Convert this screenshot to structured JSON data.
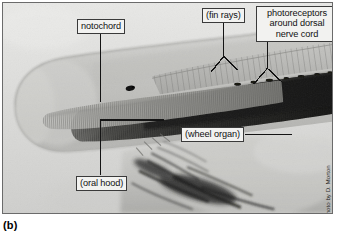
{
  "figure": {
    "panel_letter": "(b)",
    "photo_credit": "Photo by D. Morton"
  },
  "callouts": {
    "notochord": {
      "label": "notochord"
    },
    "fin_rays": {
      "label": "(fin rays)"
    },
    "photoreceptors": {
      "line1": "photoreceptors",
      "line2": "around dorsal",
      "line3": "nerve cord"
    },
    "wheel_organ": {
      "label": "(wheel organ)"
    },
    "oral_hood": {
      "label": "(oral hood)"
    }
  },
  "colors": {
    "frame_border": "#6b6b6b",
    "callout_fill": "#f2f2f0",
    "callout_border": "#3a3a3a",
    "leader_line": "#1a1a1a",
    "photo_background": "#d9d9d9",
    "body_light": "#c9c9c7",
    "myotome_dark": "#2e2e2e",
    "text": "#111111"
  }
}
